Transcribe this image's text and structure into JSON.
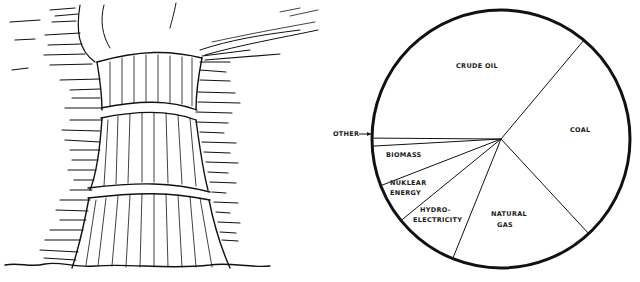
{
  "illustration": {
    "subject": "cooling-tower-with-smoke",
    "alt": "Hand-drawn cooling tower emitting steam"
  },
  "chart_data": {
    "type": "pie",
    "title": "",
    "start_angle_deg": 40,
    "direction": "clockwise",
    "labels": [
      "Coal",
      "Natural Gas",
      "Hydro-electricity",
      "Nuclear Energy",
      "Biomass",
      "Other",
      "Crude Oil"
    ],
    "display_labels": [
      "COAL",
      "NATURAL GAS",
      "HYDRO- ELECTRICITY",
      "NUKLEAR ENERGY",
      "BIOMASS",
      "OTHER",
      "CRUDE OIL"
    ],
    "values": [
      27,
      18,
      8,
      5,
      5,
      1,
      36
    ],
    "unit": "percent (estimated from slice angles)",
    "annotations": [
      {
        "text": "OTHER",
        "style": "arrow pointing to thin slice"
      }
    ],
    "legend": "none",
    "colors": {
      "stroke": "#111111",
      "fill": "#ffffff"
    }
  },
  "labels": {
    "crude_oil": "CRUDE OIL",
    "coal": "COAL",
    "natural_gas_1": "NATURAL",
    "natural_gas_2": "GAS",
    "hydro_1": "HYDRO-",
    "hydro_2": "ELECTRICITY",
    "nuclear_1": "NUKLEAR",
    "nuclear_2": "ENERGY",
    "biomass": "BIOMASS",
    "other": "OTHER"
  }
}
